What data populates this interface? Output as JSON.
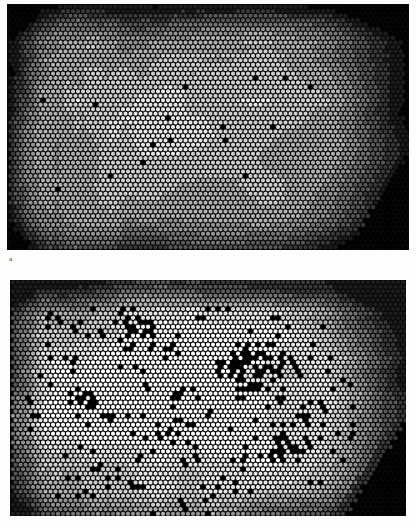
{
  "figure": {
    "type": "som-hexagonal-map-figure",
    "background_color": "#fdfdfc",
    "panel_background_color": "#0a0806"
  },
  "labels": {
    "panel_a": "a"
  },
  "panels": [
    {
      "id": "a",
      "name": "upper-hexagonal-map",
      "x": 7,
      "y": 4,
      "width": 402,
      "height": 246,
      "cols": 80,
      "rows": 55,
      "cell_diameter": 4.0,
      "col_spacing": 5.0,
      "row_spacing": 4.45,
      "seed": 20117,
      "description": "Hexagonally packed circular nodes shaded from black through grays to white forming a large bright central region with dark borders and a black lower-right corner",
      "shade_levels": [
        "#000000",
        "#1c1c1c",
        "#3a3a3a",
        "#585858",
        "#767676",
        "#949494",
        "#b2b2b2",
        "#d0d0d0",
        "#e8e8e8",
        "#ffffff"
      ],
      "black_speck_density": 0.012,
      "dark_corner": {
        "position": "lower-right",
        "strength": 1.0
      }
    },
    {
      "id": "b",
      "name": "lower-hexagonal-map",
      "x": 10,
      "y": 280,
      "width": 396,
      "height": 236,
      "cols": 79,
      "rows": 53,
      "cell_diameter": 4.0,
      "col_spacing": 5.0,
      "row_spacing": 4.45,
      "seed": 77341,
      "description": "Hexagonally packed circular nodes with a predominantly white interior heavily peppered with black clusters and dark gray borders, black lower-right corner",
      "shade_levels": [
        "#000000",
        "#1c1c1c",
        "#3a3a3a",
        "#585858",
        "#767676",
        "#949494",
        "#b2b2b2",
        "#d0d0d0",
        "#e8e8e8",
        "#ffffff"
      ],
      "black_speck_density": 0.075,
      "dark_corner": {
        "position": "lower-right",
        "strength": 1.0
      }
    }
  ],
  "chart_data": {
    "type": "heatmap",
    "title": "",
    "subtitle": "",
    "xlabel": "",
    "ylabel": "",
    "grid": false,
    "legend": "none",
    "lattice": "hexagonal",
    "value_range": [
      0,
      1
    ],
    "colormap": "grayscale-black-to-white",
    "maps": [
      {
        "label": "a",
        "cols": 80,
        "rows": 55,
        "note": "Component plane / U-matrix style grayscale map. Bright (high) plateau occupies the central and left-central area; dark (low) values ring the top, left and right margins; an extended solid-black zone fills the lower-right corner."
      },
      {
        "label": "b",
        "cols": 79,
        "rows": 53,
        "note": "Second component plane of the same self-organizing map. Interior is largely white (high) with dense scattered black (zero) nodes forming branching clusters in the upper-middle and right-of-centre; grayscale gradient borders at left and right; solid-black lower-right corner."
      }
    ]
  }
}
